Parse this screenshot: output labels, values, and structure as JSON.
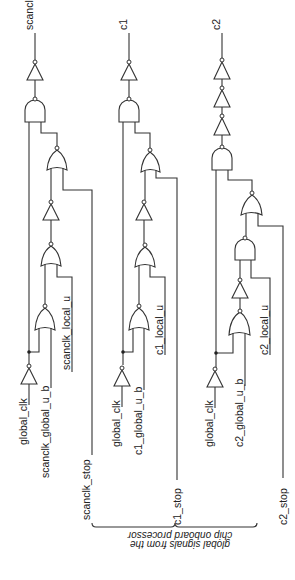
{
  "figure": {
    "colors": {
      "line": "#333333",
      "background": "#ffffff"
    }
  },
  "outputs": {
    "scanclk": "scanclk",
    "c1": "c1",
    "c2": "c2"
  },
  "inputs": {
    "scanclk_col": {
      "global_clk": "global_clk",
      "global_u_b": "scanclk_global_u_b",
      "local_u": "scanclk_local_u",
      "stop": "scanclk_stop"
    },
    "c1_col": {
      "global_clk": "global_clk",
      "global_u_b": "c1_global_u_b",
      "local_u": "c1_local_u",
      "stop": "c1_stop"
    },
    "c2_col": {
      "global_clk": "global_clk",
      "global_u_b": "c2_global_u_b",
      "local_u": "c2_local_u",
      "stop": "c2_stop"
    }
  },
  "bracket_note": {
    "line1": "global signals from the",
    "line2": "chip onboard processor"
  }
}
